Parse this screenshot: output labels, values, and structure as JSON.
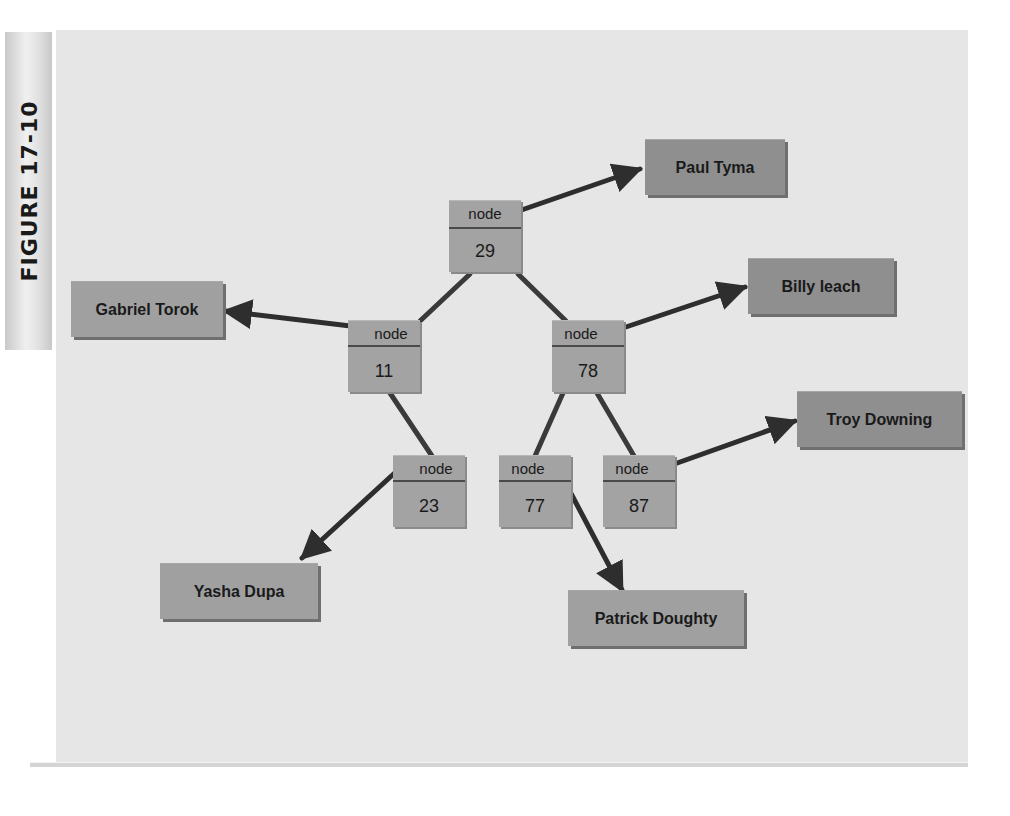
{
  "figure": {
    "label": "FIGURE 17-10"
  },
  "tree": {
    "node_label": "node",
    "nodes": [
      {
        "id": "n29",
        "key": "29",
        "name": "Paul Tyma"
      },
      {
        "id": "n11",
        "key": "11",
        "name": "Gabriel Torok"
      },
      {
        "id": "n78",
        "key": "78",
        "name": "Billy leach"
      },
      {
        "id": "n23",
        "key": "23",
        "name": "Yasha Dupa"
      },
      {
        "id": "n77",
        "key": "77",
        "name": "Patrick Doughty"
      },
      {
        "id": "n87",
        "key": "87",
        "name": "Troy Downing"
      }
    ],
    "edges": [
      [
        "29",
        "11"
      ],
      [
        "29",
        "78"
      ],
      [
        "11",
        "23"
      ],
      [
        "78",
        "77"
      ],
      [
        "78",
        "87"
      ]
    ]
  },
  "colors": {
    "panel_bg": "#e6e6e6",
    "node_fill": "#a3a3a3",
    "name_fill": "#8f8f8f",
    "line": "#3a3a3a"
  }
}
